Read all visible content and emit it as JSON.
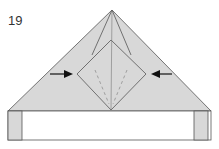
{
  "step_number": "19",
  "colors": {
    "paper_fill": "#d8d8d8",
    "paper_white": "#ffffff",
    "line": "#555555",
    "arrow": "#111111"
  },
  "diagram": {
    "arrows": [
      "left-arrow-pointing-right",
      "right-arrow-pointing-left"
    ]
  }
}
